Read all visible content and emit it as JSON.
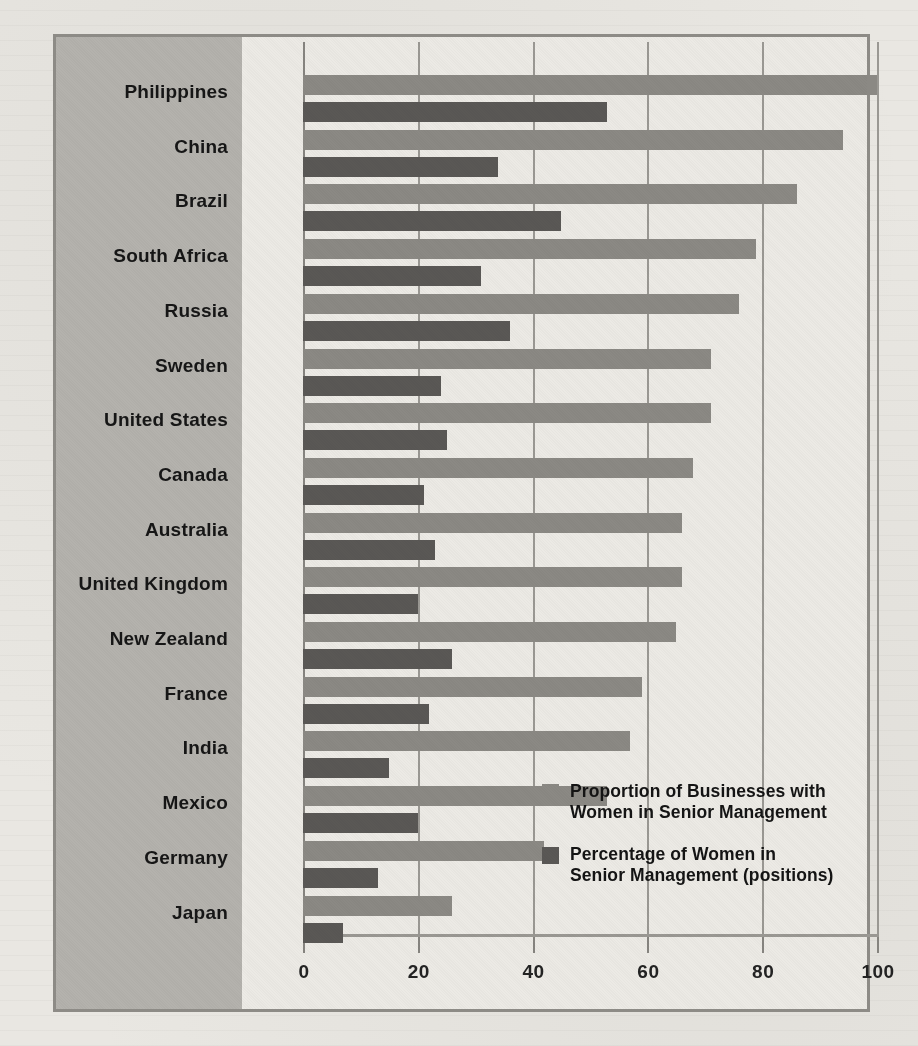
{
  "chart_data": {
    "type": "bar",
    "orientation": "horizontal",
    "title": "",
    "xlabel": "",
    "ylabel": "",
    "xlim": [
      0,
      100
    ],
    "xticks": [
      0,
      20,
      40,
      60,
      80,
      100
    ],
    "grid": true,
    "legend_position": "inside-bottom-right",
    "categories": [
      "Philippines",
      "China",
      "Brazil",
      "South Africa",
      "Russia",
      "Sweden",
      "United States",
      "Canada",
      "Australia",
      "United Kingdom",
      "New Zealand",
      "France",
      "India",
      "Mexico",
      "Germany",
      "Japan"
    ],
    "series": [
      {
        "name": "Proportion of Businesses with Women in Senior Management",
        "color": "#8b8984",
        "values": [
          100,
          94,
          86,
          79,
          76,
          71,
          71,
          68,
          66,
          66,
          65,
          59,
          57,
          53,
          42,
          26
        ]
      },
      {
        "name": "Percentage of Women in Senior Management (positions)",
        "color": "#5a5855",
        "values": [
          53,
          34,
          45,
          31,
          36,
          24,
          25,
          21,
          23,
          20,
          26,
          22,
          15,
          20,
          13,
          7
        ]
      }
    ]
  },
  "legend": {
    "items": [
      {
        "line1": "Proportion of Businesses with",
        "line2": "Women in Senior Management",
        "swatch": "light"
      },
      {
        "line1": "Percentage of Women in",
        "line2": "Senior Management (positions)",
        "swatch": "dark"
      }
    ]
  },
  "axis": {
    "tick_labels": [
      "0",
      "20",
      "40",
      "60",
      "80",
      "100"
    ]
  },
  "colors": {
    "light_bar": "#8b8984",
    "dark_bar": "#5a5855",
    "label_panel": "#b4b2ad",
    "plot_background": "#eceae5",
    "frame": "#8d8b86"
  }
}
